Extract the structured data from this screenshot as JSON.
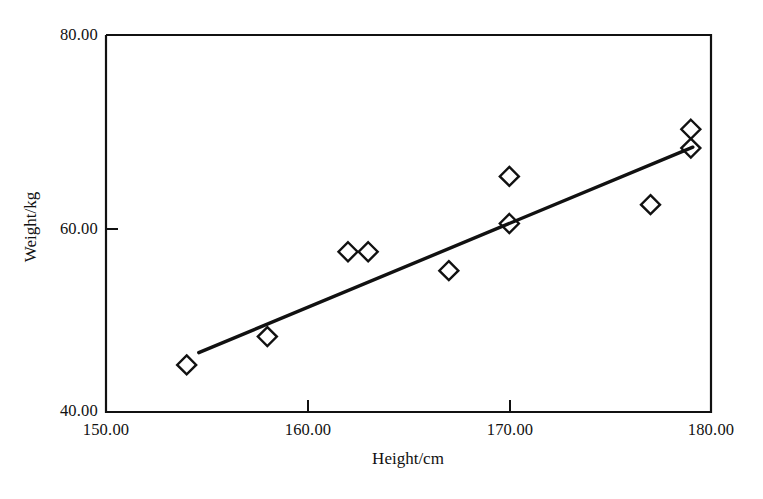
{
  "chart_data": {
    "type": "scatter",
    "title": "",
    "xlabel": "Height/cm",
    "ylabel": "Weight/kg",
    "xlim": [
      150,
      180
    ],
    "ylim": [
      40,
      80
    ],
    "xticks": [
      "150.00",
      "160.00",
      "170.00",
      "180.00"
    ],
    "xtick_values": [
      150,
      160,
      170,
      180
    ],
    "yticks": [
      "40.00",
      "60.00",
      "80.00"
    ],
    "ytick_values": [
      40,
      60,
      80
    ],
    "grid": false,
    "legend": "none",
    "marker": "open-diamond",
    "marker_color": "#111111",
    "x": [
      154,
      158,
      162,
      163,
      167,
      170,
      170,
      177,
      179,
      179
    ],
    "y": [
      45,
      48,
      57,
      57,
      55,
      65,
      60,
      62,
      70,
      68
    ],
    "points": [
      {
        "height": 154,
        "weight": 45
      },
      {
        "height": 158,
        "weight": 48
      },
      {
        "height": 162,
        "weight": 57
      },
      {
        "height": 163,
        "weight": 57
      },
      {
        "height": 167,
        "weight": 55
      },
      {
        "height": 170,
        "weight": 65
      },
      {
        "height": 170,
        "weight": 60
      },
      {
        "height": 177,
        "weight": 62
      },
      {
        "height": 179,
        "weight": 70
      },
      {
        "height": 179,
        "weight": 68
      }
    ],
    "trendline": {
      "type": "linear-fit",
      "x_start": 154.6,
      "y_start": 46.3,
      "x_end": 179.1,
      "y_end": 68.1,
      "color": "#111111"
    }
  },
  "axes": {
    "x_label": "Height/cm",
    "y_label": "Weight/kg",
    "x_tick_labels": [
      "150.00",
      "160.00",
      "170.00",
      "180.00"
    ],
    "y_tick_labels": [
      "80.00",
      "60.00",
      "40.00"
    ]
  }
}
